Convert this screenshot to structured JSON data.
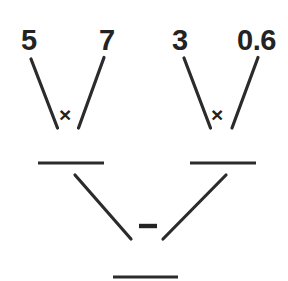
{
  "diagram": {
    "type": "arithmetic-factor-tree",
    "stroke_color": "#2b2b2b",
    "text_color": "#232323",
    "background_color": "#ffffff",
    "operands": {
      "top_left_a": "5",
      "top_left_b": "7",
      "top_right_a": "3",
      "top_right_b": "0.6"
    },
    "operators": {
      "left_branch": "×",
      "right_branch": "×",
      "bottom_branch": "–"
    },
    "blanks": {
      "left_result": "",
      "right_result": "",
      "final_result": ""
    }
  }
}
